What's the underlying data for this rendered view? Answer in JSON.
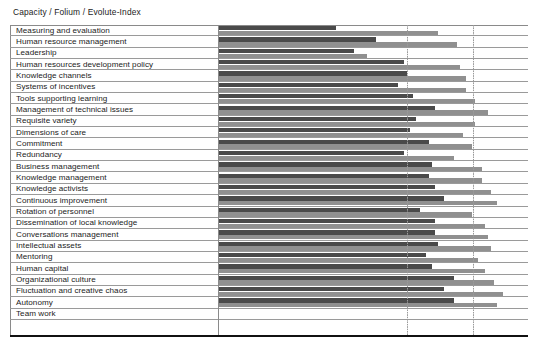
{
  "chart_title": "Capacity / Folium / Evolute-Index",
  "axis": {
    "category_axis_label": "",
    "value_axis_label": "",
    "gridline_count": 2
  },
  "legend": {
    "series_names": [
      "Capacity",
      "Folium"
    ],
    "visible": false
  },
  "colors": {
    "capacity_bar": "#4a4a4a",
    "folium_bar": "#909090",
    "rule": "#9a9a9a",
    "frame": "#8a8a8a",
    "bottom_rule": "#111111",
    "background": "#ffffff",
    "text": "#1b1b1b"
  },
  "chart_data": {
    "type": "bar",
    "title": "Capacity / Folium / Evolute-Index",
    "xlabel": "",
    "ylabel": "",
    "orientation": "horizontal",
    "grid": true,
    "legend_position": "none",
    "xlim": [
      0,
      100
    ],
    "gridline_values": [
      60,
      80
    ],
    "categories": [
      "Measuring and evaluation",
      "Human resource management",
      "Leadership",
      "Human resources development policy",
      "Knowledge channels",
      "Systems of incentives",
      "Tools supporting learning",
      "Management of technical issues",
      "Requisite variety",
      "Dimensions of care",
      "Commitment",
      "Redundancy",
      "Business management",
      "Knowledge management",
      "Knowledge activists",
      "Continuous improvement",
      "Rotation of personnel",
      "Dissemination of local knowledge",
      "Conversations management",
      "Intellectual assets",
      "Mentoring",
      "Human capital",
      "Organizational culture",
      "Fluctuation and creative chaos",
      "Autonomy",
      "Team work"
    ],
    "series": [
      {
        "name": "Capacity",
        "values": [
          38,
          51,
          44,
          60,
          61,
          58,
          63,
          70,
          64,
          62,
          68,
          60,
          69,
          68,
          70,
          73,
          65,
          70,
          70,
          71,
          67,
          69,
          76,
          73,
          76,
          null
        ]
      },
      {
        "name": "Folium",
        "values": [
          71,
          77,
          48,
          78,
          80,
          80,
          83,
          87,
          83,
          79,
          82,
          76,
          85,
          85,
          88,
          90,
          82,
          86,
          87,
          88,
          84,
          86,
          89,
          92,
          90,
          null
        ]
      }
    ]
  },
  "rows": [
    {
      "label": "Measuring and evaluation",
      "capacity": 38,
      "folium": 71
    },
    {
      "label": "Human resource management",
      "capacity": 51,
      "folium": 77
    },
    {
      "label": "Leadership",
      "capacity": 44,
      "folium": 48
    },
    {
      "label": "Human resources development policy",
      "capacity": 60,
      "folium": 78
    },
    {
      "label": "Knowledge channels",
      "capacity": 61,
      "folium": 80
    },
    {
      "label": "Systems of incentives",
      "capacity": 58,
      "folium": 80
    },
    {
      "label": "Tools supporting learning",
      "capacity": 63,
      "folium": 83
    },
    {
      "label": "Management of technical issues",
      "capacity": 70,
      "folium": 87
    },
    {
      "label": "Requisite variety",
      "capacity": 64,
      "folium": 83
    },
    {
      "label": "Dimensions of care",
      "capacity": 62,
      "folium": 79
    },
    {
      "label": "Commitment",
      "capacity": 68,
      "folium": 82
    },
    {
      "label": "Redundancy",
      "capacity": 60,
      "folium": 76
    },
    {
      "label": "Business management",
      "capacity": 69,
      "folium": 85
    },
    {
      "label": "Knowledge management",
      "capacity": 68,
      "folium": 85
    },
    {
      "label": "Knowledge activists",
      "capacity": 70,
      "folium": 88
    },
    {
      "label": "Continuous improvement",
      "capacity": 73,
      "folium": 90
    },
    {
      "label": "Rotation of personnel",
      "capacity": 65,
      "folium": 82
    },
    {
      "label": "Dissemination of local knowledge",
      "capacity": 70,
      "folium": 86
    },
    {
      "label": "Conversations management",
      "capacity": 70,
      "folium": 87
    },
    {
      "label": "Intellectual assets",
      "capacity": 71,
      "folium": 88
    },
    {
      "label": "Mentoring",
      "capacity": 67,
      "folium": 84
    },
    {
      "label": "Human capital",
      "capacity": 69,
      "folium": 86
    },
    {
      "label": "Organizational culture",
      "capacity": 76,
      "folium": 89
    },
    {
      "label": "Fluctuation and creative chaos",
      "capacity": 73,
      "folium": 92
    },
    {
      "label": "Autonomy",
      "capacity": 76,
      "folium": 90
    },
    {
      "label": "Team work",
      "capacity": null,
      "folium": null
    }
  ]
}
